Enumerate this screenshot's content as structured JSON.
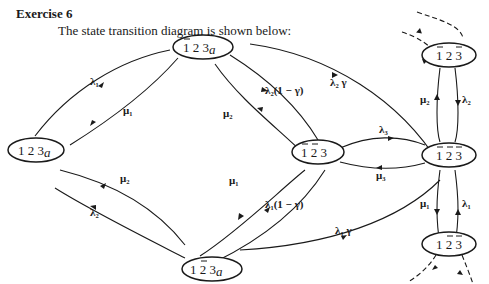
{
  "heading": "Exercise 6",
  "intro": "The state transition diagram is shown below:",
  "nodes": {
    "n123a": {
      "d1": "1",
      "d2": "2",
      "d3": "3",
      "sub": "a"
    },
    "nb1_23a": {
      "d1": "1",
      "d2": "2",
      "d3": "3",
      "sub": "a"
    },
    "n1_b2_3a": {
      "d1": "1",
      "d2": "2",
      "d3": "3",
      "sub": "a"
    },
    "nb1b2_3": {
      "d1": "1",
      "d2": "2",
      "d3": "3"
    },
    "nb1_2_b3": {
      "d1": "1",
      "d2": "2",
      "d3": "3"
    },
    "nb1b2b3": {
      "d1": "1",
      "d2": "2",
      "d3": "3"
    },
    "n1b2b3": {
      "d1": "1",
      "d2": "2",
      "d3": "3"
    }
  },
  "edges": {
    "lambda1_a": "λ₁",
    "mu1_a": "μ₁",
    "mu2_a": "μ₂",
    "lambda2_a": "λ₂",
    "lambda2_gamma": "λ₂ γ",
    "lambda2_1mg": "λ₂(1 − γ)",
    "mu2_b": "μ₂",
    "mu1_b": "μ₁",
    "lambda1_1mg": "λ₁(1 − γ)",
    "lambda1_gamma": "λ₁ γ",
    "lambda3": "λ₃",
    "mu3": "μ₃",
    "mu2_c": "μ₂",
    "lambda2_c": "λ₂",
    "mu1_c": "μ₁",
    "lambda1_c": "λ₁"
  }
}
